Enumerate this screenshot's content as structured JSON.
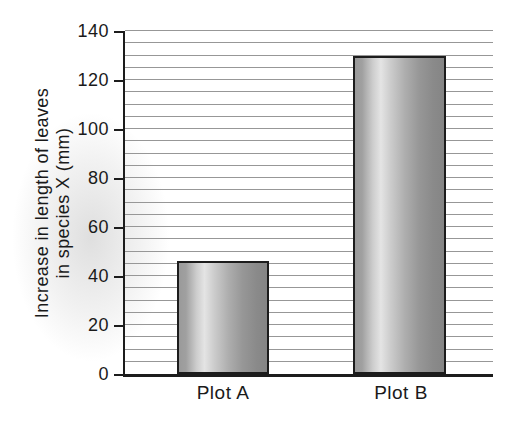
{
  "chart_data": {
    "type": "bar",
    "title": "",
    "categories": [
      "Plot A",
      "Plot B"
    ],
    "values": [
      46,
      130
    ],
    "xlabel": "",
    "ylabel": "Increase in length of leaves in species X (mm)",
    "ylabel_lines": [
      "Increase in length of leaves",
      "in species X (mm)"
    ],
    "ylim": [
      0,
      140
    ],
    "yticks": [
      0,
      20,
      40,
      60,
      80,
      100,
      120,
      140
    ],
    "ytick_step": 20,
    "gridline_step": 5,
    "grid": "horizontal",
    "legend": "none"
  },
  "colors": {
    "axis": "#1c1c1c",
    "gridline": "#979797",
    "text": "#1a1a1a",
    "bar_border": "#1c1c1c",
    "bar_dark": "#858585",
    "bar_mid": "#9a9a9a",
    "bar_light": "#e4e4e4",
    "background": "#ffffff"
  }
}
